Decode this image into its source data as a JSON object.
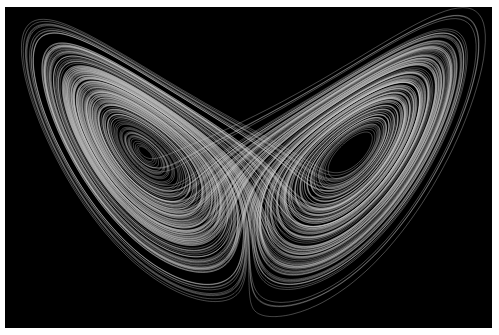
{
  "image": {
    "subject": "Lorenz attractor",
    "description": "Butterfly-shaped strange attractor rendered as thin light-grey trajectory lines on black",
    "colors": {
      "background": "#000000",
      "border": "#ffffff",
      "stroke": "#d8d8d8"
    },
    "lobes": [
      {
        "name": "left-lobe",
        "hole_center": [
          172,
          156
        ]
      },
      {
        "name": "right-lobe",
        "hole_center": [
          320,
          156
        ]
      }
    ]
  }
}
